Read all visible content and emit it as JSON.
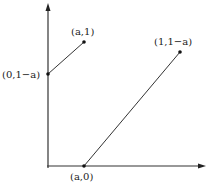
{
  "diagram": {
    "type": "coordinate-plot",
    "axes": {
      "x_axis": {
        "from": [
          48,
          166
        ],
        "to": [
          205,
          166
        ]
      },
      "y_axis": {
        "from": [
          48,
          166
        ],
        "to": [
          48,
          4
        ]
      }
    },
    "points": [
      {
        "id": "p1",
        "label": "(0,1−a)",
        "x": 48,
        "y": 74
      },
      {
        "id": "p2",
        "label": "(a,1)",
        "x": 84,
        "y": 42
      },
      {
        "id": "p3",
        "label": "(1,1−a)",
        "x": 180,
        "y": 52
      },
      {
        "id": "p4",
        "label": "(a,0)",
        "x": 84,
        "y": 166
      }
    ],
    "segments": [
      {
        "from": "p1",
        "to": "p2"
      },
      {
        "from": "p4",
        "to": "p3"
      }
    ],
    "colors": {
      "line": "#333333",
      "point": "#111111"
    }
  },
  "labels": {
    "p1": "(0,1−a)",
    "p2": "(a,1)",
    "p3": "(1,1−a)",
    "p4": "(a,0)"
  }
}
